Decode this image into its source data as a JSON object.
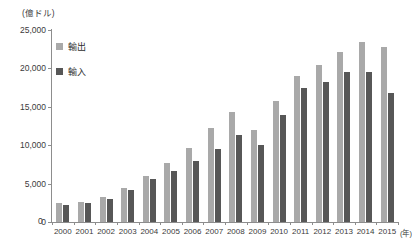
{
  "chart_data": {
    "type": "bar",
    "title": "",
    "unit_label": "(億ドル)",
    "xlabel": "(年)",
    "ylabel": "",
    "ylim": [
      0,
      25000
    ],
    "yticks": [
      0,
      5000,
      10000,
      15000,
      20000,
      25000
    ],
    "ytick_labels": [
      "0",
      "5,000",
      "10,000",
      "15,000",
      "20,000",
      "25,000"
    ],
    "grid": false,
    "legend_position": "upper-left-inside",
    "categories": [
      "2000",
      "2001",
      "2002",
      "2003",
      "2004",
      "2005",
      "2006",
      "2007",
      "2008",
      "2009",
      "2010",
      "2011",
      "2012",
      "2013",
      "2014",
      "2015"
    ],
    "series": [
      {
        "name": "輸出",
        "color": "#a9a9a9",
        "values": [
          2492,
          2661,
          3256,
          4382,
          5933,
          7620,
          9689,
          12180,
          14307,
          12016,
          15778,
          18984,
          20487,
          22096,
          23423,
          22735
        ]
      },
      {
        "name": "輸入",
        "color": "#575757",
        "values": [
          2251,
          2436,
          2952,
          4128,
          5612,
          6600,
          7915,
          9560,
          11326,
          10059,
          13962,
          17435,
          18184,
          19500,
          19592,
          16796
        ]
      }
    ]
  },
  "legend": {
    "items": [
      {
        "label": "輸出",
        "color": "#a9a9a9"
      },
      {
        "label": "輸入",
        "color": "#575757"
      }
    ]
  },
  "axis": {
    "unit": "(億ドル)",
    "x_title": "(年)"
  },
  "colors": {
    "export_bar": "#a9a9a9",
    "import_bar": "#575757",
    "axis_line": "#8d8d8d",
    "text": "#3b3b3b",
    "background": "#ffffff"
  }
}
